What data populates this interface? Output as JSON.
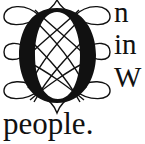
{
  "dropcap": {
    "letter": "O",
    "ornament": "interlaced-loops-and-lattice",
    "color": "#111111"
  },
  "text": {
    "line1": "n",
    "line2": "in",
    "line3": "W",
    "continuation": "people."
  }
}
